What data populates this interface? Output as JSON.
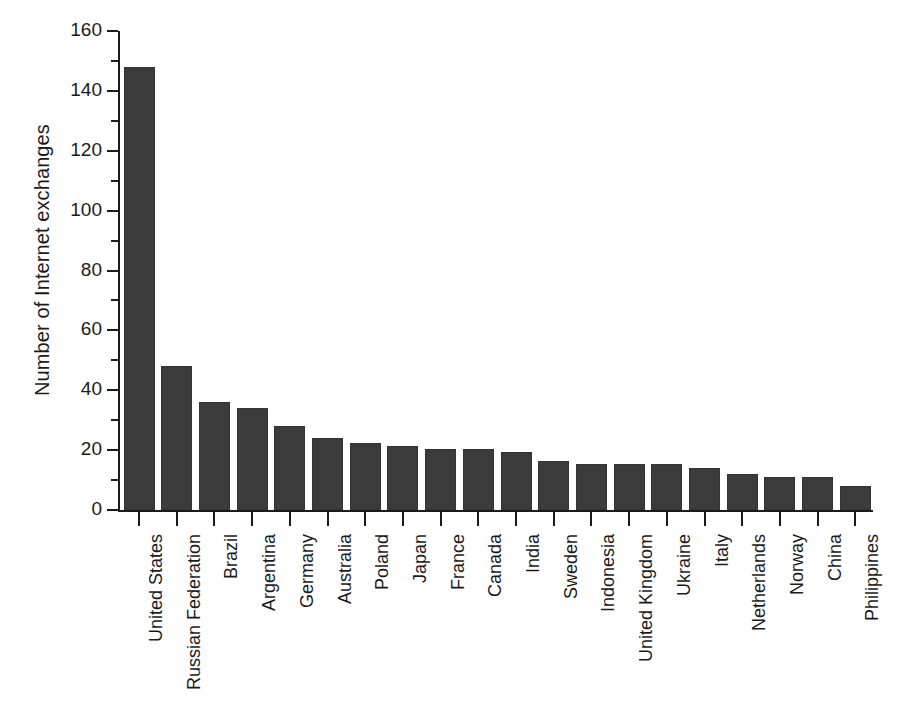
{
  "chart_data": {
    "type": "bar",
    "title": "",
    "subtitle": "",
    "xlabel": "",
    "ylabel": "Number of Internet exchanges",
    "ylim": [
      0,
      160
    ],
    "y_major_ticks": [
      0,
      20,
      40,
      60,
      80,
      100,
      120,
      140,
      160
    ],
    "y_minor_ticks": [
      10,
      30,
      50,
      70,
      90,
      110,
      130,
      150
    ],
    "grid": false,
    "legend": null,
    "bar_color": "#3b3b3b",
    "axis_color": "#1b1b1b",
    "background": "#ffffff",
    "categories": [
      "United States",
      "Russian Federation",
      "Brazil",
      "Argentina",
      "Germany",
      "Australia",
      "Poland",
      "Japan",
      "France",
      "Canada",
      "India",
      "Sweden",
      "Indonesia",
      "United Kingdom",
      "Ukraine",
      "Italy",
      "Netherlands",
      "Norway",
      "China",
      "Philippines"
    ],
    "values": [
      148,
      48,
      36,
      34,
      28,
      24,
      22.5,
      21.5,
      20.5,
      20.5,
      19.5,
      16.5,
      15.5,
      15.5,
      15.5,
      14,
      12,
      11,
      11,
      8
    ]
  }
}
